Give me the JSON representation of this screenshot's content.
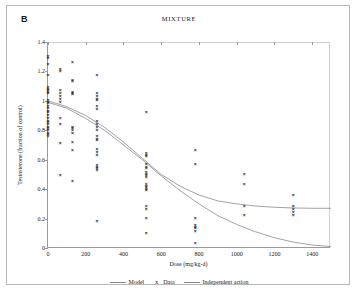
{
  "figure": {
    "panel_label": "B",
    "title": "MIXTURE",
    "border_color": "#b9b9b9",
    "background": "#ffffff"
  },
  "legend": {
    "position": "bottom-center",
    "entries": [
      {
        "label": "Model",
        "symbol": "line",
        "color": "#8a8a8a"
      },
      {
        "label": "Data",
        "symbol": "x",
        "color": "#222222"
      },
      {
        "label": "Independent action",
        "symbol": "line",
        "color": "#8a8a8a"
      }
    ]
  },
  "chart_data": {
    "type": "scatter",
    "title": "MIXTURE",
    "subtitle": "B",
    "xlabel": "Dose (mg/kg-d)",
    "ylabel": "Testosterone (fraction of control)",
    "xlim": [
      0,
      1500
    ],
    "ylim": [
      0,
      1.4
    ],
    "xticks": [
      0,
      200,
      400,
      600,
      800,
      1000,
      1200,
      1400
    ],
    "yticks": [
      0,
      0.2,
      0.4,
      0.6,
      0.8,
      1,
      1.2,
      1.4
    ],
    "grid": false,
    "axis_line_color": "#9a9a9a",
    "marker_symbol": "x",
    "marker_color": "#222222",
    "dose_groups": [
      0,
      65,
      130,
      260,
      520,
      780,
      1040,
      1300
    ],
    "series": [
      {
        "name": "Data",
        "type": "scatter",
        "points": [
          [
            0,
            1.3
          ],
          [
            0,
            1.29
          ],
          [
            0,
            1.25
          ],
          [
            0,
            1.17
          ],
          [
            0,
            1.09
          ],
          [
            0,
            1.08
          ],
          [
            0,
            1.07
          ],
          [
            0,
            1.06
          ],
          [
            0,
            1.05
          ],
          [
            0,
            1.0
          ],
          [
            0,
            0.99
          ],
          [
            0,
            0.98
          ],
          [
            0,
            0.96
          ],
          [
            0,
            0.95
          ],
          [
            0,
            0.93
          ],
          [
            0,
            0.92
          ],
          [
            0,
            0.9
          ],
          [
            0,
            0.88
          ],
          [
            0,
            0.86
          ],
          [
            0,
            0.85
          ],
          [
            0,
            0.84
          ],
          [
            0,
            0.82
          ],
          [
            0,
            0.81
          ],
          [
            0,
            0.8
          ],
          [
            0,
            0.78
          ],
          [
            0,
            0.77
          ],
          [
            0,
            0.76
          ],
          [
            65,
            1.21
          ],
          [
            65,
            1.2
          ],
          [
            65,
            1.07
          ],
          [
            65,
            1.05
          ],
          [
            65,
            1.03
          ],
          [
            65,
            1.01
          ],
          [
            65,
            0.99
          ],
          [
            65,
            0.88
          ],
          [
            65,
            0.84
          ],
          [
            65,
            0.71
          ],
          [
            65,
            0.49
          ],
          [
            130,
            1.26
          ],
          [
            130,
            1.14
          ],
          [
            130,
            1.13
          ],
          [
            130,
            1.06
          ],
          [
            130,
            1.05
          ],
          [
            130,
            1.04
          ],
          [
            130,
            0.82
          ],
          [
            130,
            0.81
          ],
          [
            130,
            0.8
          ],
          [
            130,
            0.78
          ],
          [
            130,
            0.72
          ],
          [
            130,
            0.66
          ],
          [
            130,
            0.45
          ],
          [
            260,
            1.17
          ],
          [
            260,
            1.05
          ],
          [
            260,
            1.03
          ],
          [
            260,
            1.01
          ],
          [
            260,
            1.0
          ],
          [
            260,
            0.96
          ],
          [
            260,
            0.94
          ],
          [
            260,
            0.86
          ],
          [
            260,
            0.84
          ],
          [
            260,
            0.82
          ],
          [
            260,
            0.8
          ],
          [
            260,
            0.76
          ],
          [
            260,
            0.74
          ],
          [
            260,
            0.73
          ],
          [
            260,
            0.67
          ],
          [
            260,
            0.65
          ],
          [
            260,
            0.63
          ],
          [
            260,
            0.56
          ],
          [
            260,
            0.55
          ],
          [
            260,
            0.54
          ],
          [
            260,
            0.53
          ],
          [
            260,
            0.18
          ],
          [
            520,
            0.92
          ],
          [
            520,
            0.64
          ],
          [
            520,
            0.63
          ],
          [
            520,
            0.62
          ],
          [
            520,
            0.57
          ],
          [
            520,
            0.55
          ],
          [
            520,
            0.54
          ],
          [
            520,
            0.51
          ],
          [
            520,
            0.5
          ],
          [
            520,
            0.49
          ],
          [
            520,
            0.48
          ],
          [
            520,
            0.43
          ],
          [
            520,
            0.42
          ],
          [
            520,
            0.41
          ],
          [
            520,
            0.4
          ],
          [
            520,
            0.39
          ],
          [
            520,
            0.28
          ],
          [
            520,
            0.26
          ],
          [
            520,
            0.2
          ],
          [
            520,
            0.1
          ],
          [
            780,
            0.66
          ],
          [
            780,
            0.57
          ],
          [
            780,
            0.2
          ],
          [
            780,
            0.15
          ],
          [
            780,
            0.14
          ],
          [
            780,
            0.13
          ],
          [
            780,
            0.11
          ],
          [
            780,
            0.03
          ],
          [
            1040,
            0.5
          ],
          [
            1040,
            0.43
          ],
          [
            1040,
            0.28
          ],
          [
            1040,
            0.22
          ],
          [
            1300,
            0.36
          ],
          [
            1300,
            0.28
          ],
          [
            1300,
            0.26
          ],
          [
            1300,
            0.24
          ],
          [
            1300,
            0.22
          ]
        ]
      },
      {
        "name": "Model",
        "type": "line",
        "color": "#8a8a8a",
        "description": "Sigmoid decline from 1.0 plateauing near 0.27",
        "points": [
          [
            0,
            1.0
          ],
          [
            100,
            0.96
          ],
          [
            200,
            0.9
          ],
          [
            300,
            0.82
          ],
          [
            400,
            0.72
          ],
          [
            500,
            0.61
          ],
          [
            600,
            0.5
          ],
          [
            700,
            0.42
          ],
          [
            800,
            0.36
          ],
          [
            900,
            0.32
          ],
          [
            1000,
            0.3
          ],
          [
            1100,
            0.285
          ],
          [
            1200,
            0.277
          ],
          [
            1300,
            0.272
          ],
          [
            1400,
            0.27
          ],
          [
            1500,
            0.27
          ]
        ]
      },
      {
        "name": "Independent action",
        "type": "line",
        "color": "#8a8a8a",
        "description": "Monotonic decline from 1.0 toward 0 at high dose",
        "points": [
          [
            0,
            0.99
          ],
          [
            100,
            0.95
          ],
          [
            200,
            0.88
          ],
          [
            300,
            0.8
          ],
          [
            400,
            0.7
          ],
          [
            500,
            0.6
          ],
          [
            600,
            0.49
          ],
          [
            700,
            0.39
          ],
          [
            800,
            0.3
          ],
          [
            900,
            0.22
          ],
          [
            1000,
            0.16
          ],
          [
            1100,
            0.11
          ],
          [
            1200,
            0.07
          ],
          [
            1300,
            0.04
          ],
          [
            1400,
            0.02
          ],
          [
            1500,
            0.01
          ]
        ]
      }
    ]
  }
}
